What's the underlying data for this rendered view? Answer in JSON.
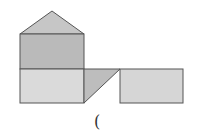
{
  "diagram": {
    "type": "geometric-net",
    "shapes": {
      "roof_triangle": {
        "points": "20,34 52,11 84,34",
        "fill": "#c6c6c6"
      },
      "upper_rect": {
        "x": 20,
        "y": 34,
        "w": 64,
        "h": 35,
        "fill": "#bababa"
      },
      "lower_rect": {
        "x": 20,
        "y": 69,
        "w": 64,
        "h": 34,
        "fill": "#dadada"
      },
      "connector_triangle": {
        "points": "84,69 120,69 84,103",
        "fill": "#bdbdbd"
      },
      "right_rect": {
        "x": 120,
        "y": 69,
        "w": 63,
        "h": 34,
        "fill": "#d6d6d6"
      }
    },
    "stroke": "#555555",
    "caption": "("
  }
}
